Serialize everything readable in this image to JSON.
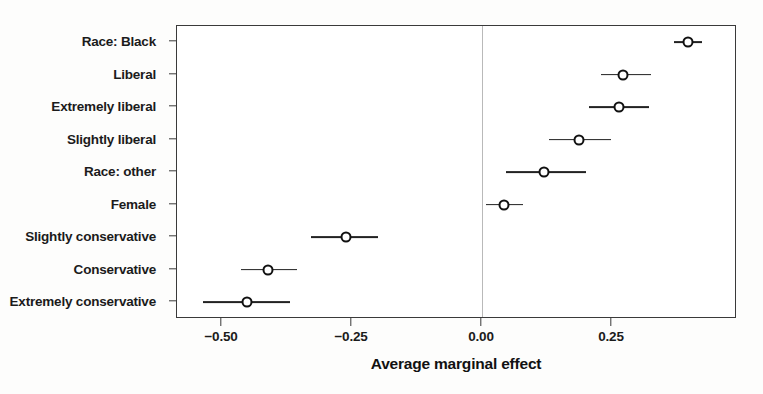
{
  "chart_data": {
    "type": "scatter",
    "subtype": "coefficient-plot-with-error-bars",
    "title": "",
    "xlabel": "Average marginal effect",
    "ylabel": "",
    "xlim": [
      -0.57,
      0.49
    ],
    "xticks": [
      -0.5,
      -0.25,
      0.0,
      0.25
    ],
    "xtick_labels": [
      "−0.50",
      "−0.25",
      "0.00",
      "0.25"
    ],
    "grid": false,
    "legend": null,
    "reference_line": 0.0,
    "categories": [
      "Race: Black",
      "Liberal",
      "Extremely liberal",
      "Slightly liberal",
      "Race: other",
      "Female",
      "Slightly conservative",
      "Conservative",
      "Extremely conservative"
    ],
    "values": [
      0.396,
      0.271,
      0.263,
      0.187,
      0.119,
      0.042,
      -0.262,
      -0.412,
      -0.452
    ],
    "ci_low": [
      0.369,
      0.229,
      0.206,
      0.129,
      0.046,
      0.008,
      -0.329,
      -0.464,
      -0.536
    ],
    "ci_high": [
      0.423,
      0.325,
      0.321,
      0.248,
      0.2,
      0.079,
      -0.2,
      -0.356,
      -0.369
    ],
    "points": [
      {
        "label": "Race: Black",
        "value": 0.396,
        "ci_low": 0.369,
        "ci_high": 0.423
      },
      {
        "label": "Liberal",
        "value": 0.271,
        "ci_low": 0.229,
        "ci_high": 0.325
      },
      {
        "label": "Extremely liberal",
        "value": 0.263,
        "ci_low": 0.206,
        "ci_high": 0.321
      },
      {
        "label": "Slightly liberal",
        "value": 0.187,
        "ci_low": 0.129,
        "ci_high": 0.248
      },
      {
        "label": "Race: other",
        "value": 0.119,
        "ci_low": 0.046,
        "ci_high": 0.2
      },
      {
        "label": "Female",
        "value": 0.042,
        "ci_low": 0.008,
        "ci_high": 0.079
      },
      {
        "label": "Slightly conservative",
        "value": -0.262,
        "ci_low": -0.329,
        "ci_high": -0.2
      },
      {
        "label": "Conservative",
        "value": -0.412,
        "ci_low": -0.464,
        "ci_high": -0.356
      },
      {
        "label": "Extremely conservative",
        "value": -0.452,
        "ci_low": -0.536,
        "ci_high": -0.369
      }
    ],
    "colors": {
      "marker": "#111111",
      "marker_fill": "#ffffff",
      "ci_line": "#222222",
      "frame": "#3a3a3a",
      "reference_line": "#b9b9b9",
      "background": "#ffffff",
      "text": "#1b1b1b"
    }
  }
}
